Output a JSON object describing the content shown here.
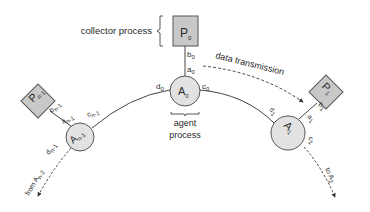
{
  "diagram": {
    "collector": {
      "label": "collector process",
      "node": {
        "main": "P",
        "sub": "0"
      }
    },
    "agent_caption": {
      "line1": "agent",
      "line2": "process"
    },
    "transmission_label": "data transmission",
    "agents": [
      {
        "id": "A0",
        "main": "A",
        "sub": "0",
        "ports": {
          "a": {
            "m": "a",
            "s": "0"
          },
          "c": {
            "m": "c",
            "s": "0"
          },
          "d": {
            "m": "d",
            "s": "0"
          }
        }
      },
      {
        "id": "An-1",
        "main": "A",
        "sub": "n-1",
        "ports": {
          "a": {
            "m": "a",
            "s": "n-1"
          },
          "c": {
            "m": "c",
            "s": "n-1"
          },
          "d": {
            "m": "d",
            "s": "n-1"
          }
        }
      },
      {
        "id": "A1",
        "main": "A",
        "sub": "1",
        "ports": {
          "a": {
            "m": "a",
            "s": "1"
          },
          "c": {
            "m": "c",
            "s": "1"
          },
          "d": {
            "m": "d",
            "s": "1"
          }
        }
      }
    ],
    "processes": [
      {
        "id": "P0",
        "main": "P",
        "sub": "0",
        "port": {
          "m": "b",
          "s": "0"
        }
      },
      {
        "id": "Pn-1",
        "main": "P",
        "sub": "n-1",
        "port": {
          "m": "b",
          "s": "n-1"
        }
      },
      {
        "id": "P1",
        "main": "P",
        "sub": "1",
        "port": {
          "m": "b",
          "s": "1"
        }
      }
    ],
    "incoming": {
      "prefix": "from ",
      "main": "A",
      "sub": "n-2"
    },
    "outgoing": {
      "prefix": "to ",
      "main": "A",
      "sub": "2"
    },
    "colors": {
      "node_fill": "#e2e2e2",
      "process_fill": "#c8c8c8",
      "stroke": "#444444"
    }
  }
}
